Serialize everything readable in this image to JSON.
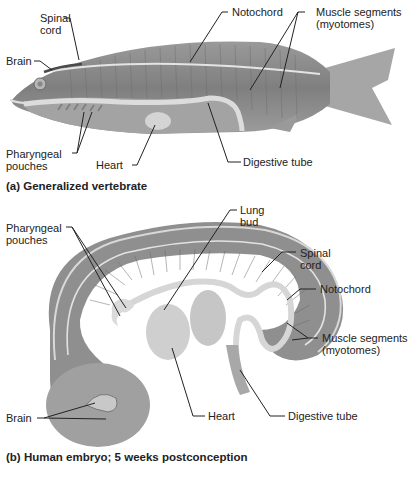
{
  "panel_a": {
    "caption": "(a) Generalized vertebrate",
    "labels": {
      "spinal_cord_1": "Spinal",
      "spinal_cord_2": "cord",
      "notochord": "Notochord",
      "muscle_1": "Muscle segments",
      "muscle_2": "(myotomes)",
      "brain": "Brain",
      "pharyngeal_1": "Pharyngeal",
      "pharyngeal_2": "pouches",
      "heart": "Heart",
      "digestive": "Digestive tube"
    }
  },
  "panel_b": {
    "caption": "(b) Human embryo; 5 weeks postconception",
    "labels": {
      "pharyngeal_1": "Pharyngeal",
      "pharyngeal_2": "pouches",
      "lung_1": "Lung",
      "lung_2": "bud",
      "spinal_cord_1": "Spinal",
      "spinal_cord_2": "cord",
      "notochord": "Notochord",
      "muscle_1": "Muscle segments",
      "muscle_2": "(myotomes)",
      "brain": "Brain",
      "heart": "Heart",
      "digestive": "Digestive tube"
    }
  },
  "colors": {
    "body_gray": "#8a8a8a",
    "body_dark": "#6e6e6e",
    "light_structure": "#d8d8d8",
    "leader_line": "#222222"
  }
}
